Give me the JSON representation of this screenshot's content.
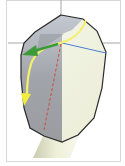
{
  "diagram": {
    "type": "anatomical-cross-section",
    "colors": {
      "background": "#ffffff",
      "frame": "#d8d8d8",
      "crosshair": "#8f8f8f",
      "outline": "#2a2a2a",
      "shaded_region": "#a7aab0",
      "light_region": "#f1f2e4",
      "bone_shaft": "#e6e8cf",
      "yellow_arrow": "#f4f06a",
      "green_arrow": "#3c9a3a",
      "red_dashed_line": "#d04a3a",
      "blue_line": "#4a7fd0"
    },
    "elements": [
      {
        "name": "crosshair-horizontal",
        "color": "#8f8f8f"
      },
      {
        "name": "crosshair-vertical",
        "color": "#8f8f8f"
      },
      {
        "name": "yellow-curved-arrow",
        "direction": "down-left"
      },
      {
        "name": "green-arrow",
        "direction": "left"
      },
      {
        "name": "red-dashed-line",
        "direction": "vertical"
      },
      {
        "name": "blue-line",
        "direction": "right"
      }
    ]
  }
}
